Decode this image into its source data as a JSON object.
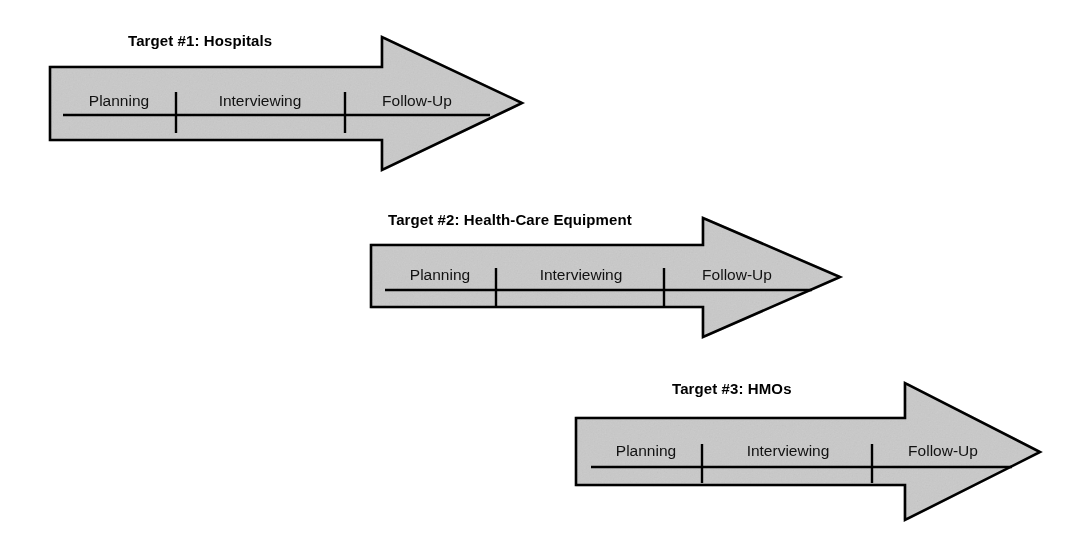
{
  "page": {
    "background_color": "#ffffff",
    "width": 1088,
    "height": 545,
    "fill_color": "#c9c9c9",
    "stroke_color": "#000000",
    "text_color": "#000000"
  },
  "diagram": {
    "type": "process-arrow-diagram",
    "phase_labels": [
      "Planning",
      "Interviewing",
      "Follow-Up"
    ],
    "arrows": [
      {
        "id": "target-1",
        "title": "Target #1: Hospitals",
        "title_x": 128,
        "title_y": 33,
        "body": {
          "x": 50,
          "y": 67,
          "w": 332,
          "h": 73
        },
        "head": {
          "shoulder_x": 382,
          "tip_x": 522,
          "top_y": 37,
          "bottom_y": 170,
          "tip_y": 103
        },
        "timeline": {
          "y": 115,
          "x_start": 63,
          "x_end": 490
        },
        "ticks": [
          176,
          345
        ],
        "tick_top": 92,
        "tick_bottom": 133,
        "phases": [
          {
            "label": "Planning",
            "cx": 119,
            "y": 92
          },
          {
            "label": "Interviewing",
            "cx": 260,
            "y": 92
          },
          {
            "label": "Follow-Up",
            "cx": 417,
            "y": 92
          }
        ]
      },
      {
        "id": "target-2",
        "title": "Target #2: Health-Care Equipment",
        "title_x": 388,
        "title_y": 212,
        "body": {
          "x": 371,
          "y": 245,
          "w": 332,
          "h": 62
        },
        "head": {
          "shoulder_x": 703,
          "tip_x": 840,
          "top_y": 218,
          "bottom_y": 337,
          "tip_y": 277
        },
        "timeline": {
          "y": 290,
          "x_start": 385,
          "x_end": 812
        },
        "ticks": [
          496,
          664
        ],
        "tick_top": 268,
        "tick_bottom": 306,
        "phases": [
          {
            "label": "Planning",
            "cx": 440,
            "y": 266
          },
          {
            "label": "Interviewing",
            "cx": 581,
            "y": 266
          },
          {
            "label": "Follow-Up",
            "cx": 737,
            "y": 266
          }
        ]
      },
      {
        "id": "target-3",
        "title": "Target #3: HMOs",
        "title_x": 672,
        "title_y": 381,
        "body": {
          "x": 576,
          "y": 418,
          "w": 329,
          "h": 67
        },
        "head": {
          "shoulder_x": 905,
          "tip_x": 1040,
          "top_y": 383,
          "bottom_y": 520,
          "tip_y": 452
        },
        "timeline": {
          "y": 467,
          "x_start": 591,
          "x_end": 1012
        },
        "ticks": [
          702,
          872
        ],
        "tick_top": 444,
        "tick_bottom": 483,
        "phases": [
          {
            "label": "Planning",
            "cx": 646,
            "y": 442
          },
          {
            "label": "Interviewing",
            "cx": 788,
            "y": 442
          },
          {
            "label": "Follow-Up",
            "cx": 943,
            "y": 442
          }
        ]
      }
    ]
  }
}
